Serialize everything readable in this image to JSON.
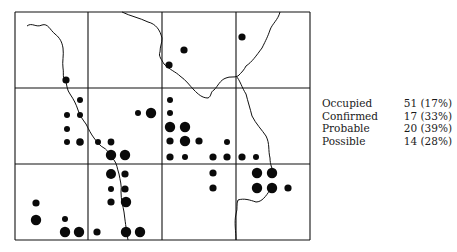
{
  "figure": {
    "type": "distribution-grid-map",
    "grid": {
      "columns": 4,
      "rows": 3,
      "x_lines": [
        15,
        88,
        162,
        236,
        310
      ],
      "y_lines": [
        12,
        88,
        164,
        240
      ]
    },
    "colors": {
      "ink": "#111111",
      "background": "#ffffff"
    }
  },
  "legend": {
    "rows": [
      {
        "label": "Occupied",
        "value": "51 (17%)"
      },
      {
        "label": "Confirmed",
        "value": "17 (33%)"
      },
      {
        "label": "Probable",
        "value": "20 (39%)"
      },
      {
        "label": "Possible",
        "value": "14 (28%)"
      }
    ]
  },
  "dots": [
    {
      "x": 66,
      "y": 80,
      "r": 3.6
    },
    {
      "x": 184,
      "y": 50,
      "r": 3.6
    },
    {
      "x": 169,
      "y": 65,
      "r": 3.6
    },
    {
      "x": 242,
      "y": 37,
      "r": 3.6
    },
    {
      "x": 80,
      "y": 100,
      "r": 3
    },
    {
      "x": 67,
      "y": 115,
      "r": 3
    },
    {
      "x": 80,
      "y": 115,
      "r": 3
    },
    {
      "x": 67,
      "y": 129,
      "r": 3
    },
    {
      "x": 67,
      "y": 142,
      "r": 3
    },
    {
      "x": 80,
      "y": 142,
      "r": 3.8
    },
    {
      "x": 98,
      "y": 142,
      "r": 3
    },
    {
      "x": 111,
      "y": 142,
      "r": 3.4
    },
    {
      "x": 111,
      "y": 155,
      "r": 5.2
    },
    {
      "x": 125,
      "y": 155,
      "r": 5.2
    },
    {
      "x": 138,
      "y": 113,
      "r": 3
    },
    {
      "x": 151,
      "y": 113,
      "r": 5.2
    },
    {
      "x": 170,
      "y": 100,
      "r": 3
    },
    {
      "x": 170,
      "y": 113,
      "r": 3
    },
    {
      "x": 170,
      "y": 127,
      "r": 5.2
    },
    {
      "x": 185,
      "y": 127,
      "r": 5.2
    },
    {
      "x": 170,
      "y": 141,
      "r": 3.6
    },
    {
      "x": 185,
      "y": 141,
      "r": 5.2
    },
    {
      "x": 199,
      "y": 141,
      "r": 3.6
    },
    {
      "x": 227,
      "y": 142,
      "r": 3
    },
    {
      "x": 170,
      "y": 157,
      "r": 3.6
    },
    {
      "x": 185,
      "y": 157,
      "r": 3
    },
    {
      "x": 213,
      "y": 157,
      "r": 3.6
    },
    {
      "x": 227,
      "y": 157,
      "r": 3.6
    },
    {
      "x": 242,
      "y": 157,
      "r": 3.6
    },
    {
      "x": 256,
      "y": 157,
      "r": 3
    },
    {
      "x": 111,
      "y": 174,
      "r": 5
    },
    {
      "x": 125,
      "y": 174,
      "r": 3.6
    },
    {
      "x": 111,
      "y": 189,
      "r": 3
    },
    {
      "x": 125,
      "y": 189,
      "r": 3.6
    },
    {
      "x": 111,
      "y": 202,
      "r": 3.6
    },
    {
      "x": 126,
      "y": 202,
      "r": 5.2
    },
    {
      "x": 213,
      "y": 173,
      "r": 3.6
    },
    {
      "x": 213,
      "y": 188,
      "r": 3.6
    },
    {
      "x": 257,
      "y": 173,
      "r": 5.2
    },
    {
      "x": 272,
      "y": 173,
      "r": 5.2
    },
    {
      "x": 257,
      "y": 188,
      "r": 5.2
    },
    {
      "x": 272,
      "y": 188,
      "r": 5.2
    },
    {
      "x": 288,
      "y": 188,
      "r": 3.6
    },
    {
      "x": 36,
      "y": 203,
      "r": 3.6
    },
    {
      "x": 36,
      "y": 220,
      "r": 5.2
    },
    {
      "x": 65,
      "y": 219,
      "r": 3
    },
    {
      "x": 65,
      "y": 232,
      "r": 5.2
    },
    {
      "x": 79,
      "y": 232,
      "r": 5.2
    },
    {
      "x": 97,
      "y": 232,
      "r": 3.6
    },
    {
      "x": 126,
      "y": 232,
      "r": 5.2
    },
    {
      "x": 140,
      "y": 232,
      "r": 5.2
    }
  ],
  "rivers": [
    "M27,26 C32,22 36,28 42,25 C48,23 50,30 55,34 C60,38 62,42 63,48 C64,55 62,62 63,68 C64,74 62,78 66,82 C67,86 67,90 70,94 C74,100 76,104 78,110 C80,116 83,120 86,124 C89,130 91,134 94,138 C97,142 100,146 104,148 C108,150 110,156 114,160 C117,164 117,168 119,174 C120,180 122,186 121,192 C121,200 123,206 124,212 C125,220 126,228 128,240",
    "M122,12 C130,16 140,18 148,22 C156,24 160,30 162,38 C162,44 160,46 160,52 C158,56 162,60 164,64 C170,70 176,72 180,76 C186,80 190,86 194,90 C198,94 202,98 208,98 C212,96 210,92 214,90 C218,86 220,80 226,78 C230,76 234,78 238,76 C242,72 244,70 246,66",
    "M246,66 C252,62 256,56 262,48 C266,40 268,36 270,30 C272,24 278,20 280,12",
    "M236,76 C240,80 242,88 246,94 C248,102 250,108 252,116 C256,124 262,130 266,136 C270,144 268,150 270,158 C270,164 272,170 276,176",
    "M236,240 C236,232 234,222 236,214 C238,208 236,204 238,200 C244,198 250,200 256,202 C262,202 266,196 270,190"
  ]
}
